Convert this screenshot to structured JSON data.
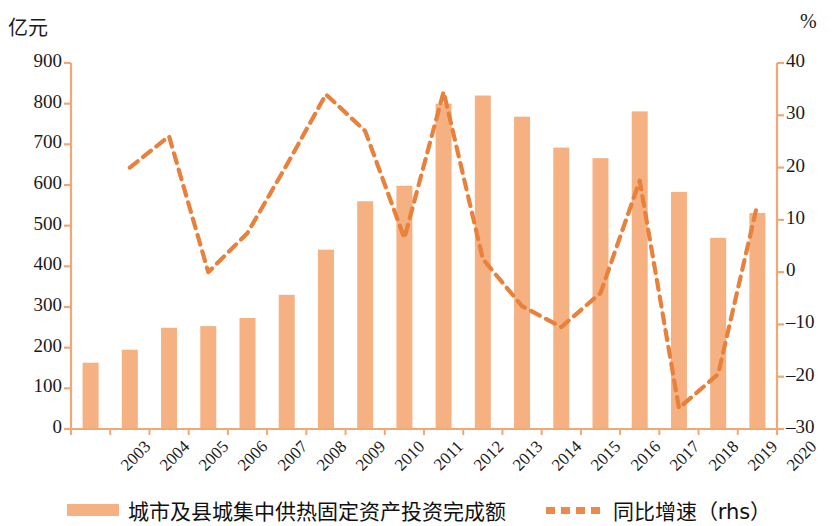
{
  "axes": {
    "left_unit": "亿元",
    "right_unit": "%"
  },
  "legend": {
    "bar_label": "城市及县城集中供热固定资产投资完成额",
    "line_label": "同比增速（rhs）"
  },
  "colors": {
    "bar": "#f6b183",
    "line": "#e8813c",
    "axis": "#f0a875",
    "text": "#1a1a1a"
  },
  "chart_data": {
    "type": "bar",
    "title": "",
    "xlabel": "",
    "ylabel": "亿元",
    "y2label": "%",
    "grid": false,
    "legend_position": "bottom",
    "categories": [
      "2003",
      "2004",
      "2005",
      "2006",
      "2007",
      "2008",
      "2009",
      "2010",
      "2011",
      "2012",
      "2013",
      "2014",
      "2015",
      "2016",
      "2017",
      "2018",
      "2019",
      "2020"
    ],
    "ylim": [
      0,
      900
    ],
    "yticks": [
      0,
      100,
      200,
      300,
      400,
      500,
      600,
      700,
      800,
      900
    ],
    "y2lim": [
      -30,
      40
    ],
    "y2ticks": [
      -30,
      -20,
      -10,
      0,
      10,
      20,
      30,
      40
    ],
    "series": [
      {
        "name": "城市及县城集中供热固定资产投资完成额",
        "type": "bar",
        "axis": "left",
        "values": [
          163,
          195,
          249,
          253,
          273,
          330,
          441,
          560,
          598,
          800,
          820,
          768,
          692,
          666,
          781,
          583,
          470,
          531
        ]
      },
      {
        "name": "同比增速（rhs）",
        "type": "line",
        "axis": "right",
        "style": "dashed",
        "values": [
          null,
          20,
          26,
          0,
          7.5,
          20.5,
          34,
          27,
          6.5,
          34.5,
          2.5,
          -6.5,
          -10.5,
          -4,
          17.5,
          -26,
          -19.5,
          13
        ]
      }
    ]
  }
}
